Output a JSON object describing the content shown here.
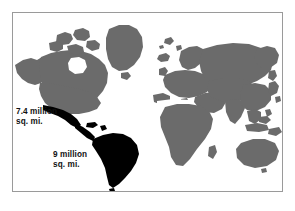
{
  "figure": {
    "type": "world-map-area-comparison",
    "background_color": "#ffffff",
    "frame": {
      "border_color": "#9a9a9a",
      "fill_color": "#ffffff"
    },
    "colors": {
      "highlight_landmass": "#000000",
      "other_landmass": "#6b6b6b",
      "ocean": "#ffffff",
      "label_text": "#111111"
    },
    "labels": [
      {
        "name": "north-area-label",
        "text": "7.4 million\nsq. mi.",
        "value": "7.4 million",
        "unit": "sq. mi."
      },
      {
        "name": "south-area-label",
        "text": "9 million\nsq. mi.",
        "value": "9 million",
        "unit": "sq. mi."
      }
    ]
  }
}
